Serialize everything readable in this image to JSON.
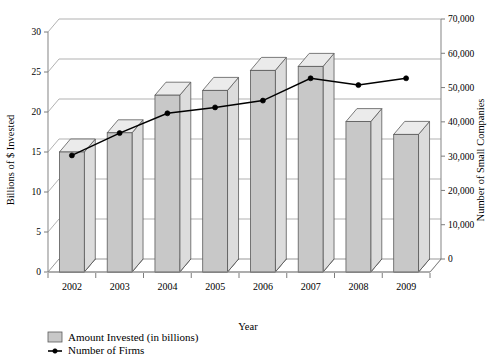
{
  "chart_data": {
    "type": "bar",
    "title": "",
    "subtitle": "",
    "xlabel": "Year",
    "categories": [
      "2002",
      "2003",
      "2004",
      "2005",
      "2006",
      "2007",
      "2008",
      "2009"
    ],
    "grid": true,
    "legend_position": "bottom-left",
    "axes": {
      "left": {
        "label": "Billions of $ Invested",
        "ticks": [
          "0",
          "5",
          "10",
          "15",
          "20",
          "25",
          "30"
        ],
        "tick_values": [
          0,
          5,
          10,
          15,
          20,
          25,
          30
        ],
        "lim": [
          0,
          30
        ]
      },
      "right": {
        "label": "Number of Small Companies",
        "ticks": [
          "0",
          "10,000",
          "20,000",
          "30,000",
          "40,000",
          "50,000",
          "60,000",
          "70,000"
        ],
        "tick_values": [
          0,
          10000,
          20000,
          30000,
          40000,
          50000,
          60000,
          70000
        ],
        "lim": [
          0,
          70000
        ]
      }
    },
    "series": [
      {
        "name": "Amount Invested (in billions)",
        "type": "bar",
        "axis": "left",
        "color": "#c8c8c8",
        "values": [
          15.0,
          17.4,
          22.1,
          22.7,
          25.2,
          25.7,
          18.8,
          17.2
        ]
      },
      {
        "name": "Number of Firms",
        "type": "line",
        "axis": "right",
        "color": "#000000",
        "values": [
          34000,
          40500,
          46300,
          48000,
          50000,
          56500,
          54500,
          56500
        ]
      }
    ]
  },
  "legend": {
    "items": [
      {
        "label": "Amount Invested (in billions)",
        "marker": "square-swatch-icon"
      },
      {
        "label": "Number of Firms",
        "marker": "line-marker-icon"
      }
    ]
  }
}
